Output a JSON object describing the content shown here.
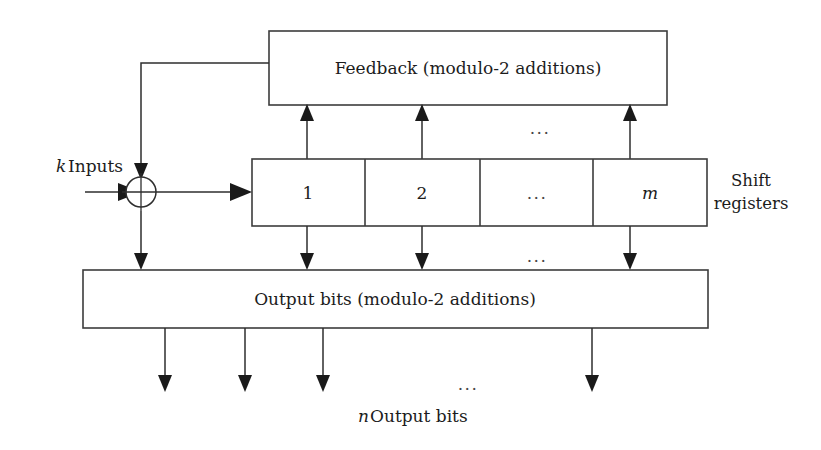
{
  "diagram": {
    "colors": {
      "stroke": "#3c3c3c",
      "wire": "#2e2e2e",
      "arrow": "#1a1a1a",
      "background": "#ffffff",
      "text": "#1c1c1c"
    },
    "blocks": {
      "feedback": {
        "label": "Feedback (modulo-2 additions)"
      },
      "output": {
        "label": "Output bits (modulo-2 additions)"
      },
      "shift_registers": {
        "side_label_line1": "Shift",
        "side_label_line2": "registers",
        "cells": [
          {
            "label": "1",
            "italic": false
          },
          {
            "label": "2",
            "italic": false
          },
          {
            "label": "...",
            "italic": false
          },
          {
            "label": "m",
            "italic": true
          }
        ]
      }
    },
    "io": {
      "input_italic": "k",
      "input_label": "Inputs",
      "output_italic": "n",
      "output_label": "Output bits"
    },
    "ellipses": {
      "feedback_gap": "...",
      "output_gap": "...",
      "bottom_gap": "..."
    },
    "adder": {
      "symbol": "xor-modulo-2-adder"
    }
  }
}
